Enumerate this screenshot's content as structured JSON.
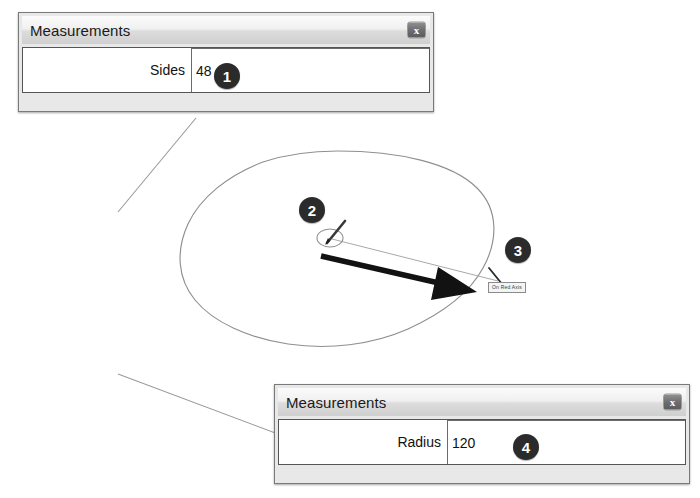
{
  "app": {
    "tool": "Circle Tool"
  },
  "dialogs": [
    {
      "id": "sides-dialog",
      "title": "Measurements",
      "close_label": "x",
      "field_label": "Sides",
      "field_value": "48",
      "field_placeholder": "",
      "badge": "1"
    },
    {
      "id": "radius-dialog",
      "title": "Measurements",
      "close_label": "x",
      "field_label": "Radius",
      "field_value": "120",
      "field_placeholder": "",
      "badge": "4"
    }
  ],
  "canvas": {
    "tooltip": "On Red Axis",
    "badges": [
      {
        "number": "2",
        "meaning": "circle-center-point"
      },
      {
        "number": "3",
        "meaning": "radius-endpoint-on-red-axis"
      }
    ]
  },
  "colors": {
    "badge_fill": "#2b2b2b",
    "badge_text": "#ffffff",
    "dialog_frame": "#e8e8e8",
    "dialog_border": "#7a7a7a",
    "dialog_body": "#ffffff",
    "titlebar_top": "#fbfbfb",
    "titlebar_bottom": "#cfcfcf",
    "geometry_stroke": "#8c8c8c",
    "arrow_fill": "#111111",
    "tooltip_bg": "#f4f4f4"
  }
}
